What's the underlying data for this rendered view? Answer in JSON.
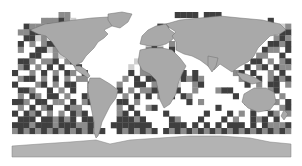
{
  "map": {
    "type": "world-grid-coverage",
    "projection": "equirectangular",
    "extent_px": {
      "x": 12,
      "y": 12,
      "width": 279,
      "height": 145
    },
    "grid": {
      "cols": 48,
      "rows": 25
    },
    "colors": {
      "background": "#ffffff",
      "land": "#a9a9a9",
      "land_border": "#6e6e6e",
      "antarctica": "#b3b3b3",
      "cell_shades": {
        "0": "#ffffff",
        "1": "#cfcfcf",
        "2": "#8c8c8c",
        "3": "#3f3f3f"
      }
    },
    "cells": [
      "000000000000000000000000000000000000000000000000",
      "000000000000000000000000000000000000000000000000",
      "000000000000000000000000000000000000000000000000",
      "000000000000000000000000000000000000000000000000",
      "000000000000000000000000000000000000000000000000",
      "000000000000000000000000000000000000000000000000",
      "000000000000000000000000000000000000000000000000",
      "000000000000000000000000000000000000000000000000",
      "000000000000000000000000000000000000000000000000",
      "000000000000000000000000000000000000000000000000",
      "000000000000000000000000000000000000000000000000",
      "000000000000000000000000000000000000000000000000",
      "000000000000000000000000000000000000000000000000",
      "000000000000000000000000000000000000000000000000",
      "000000000000000000000000000000000000000000000000",
      "000000000000000000000000000000000000000000000000",
      "000000000000000000000000000000000000000000000000",
      "000000000000000000000000000000000000000000000000",
      "000000000000000000000000000000000000000000000000",
      "000000000000000000000000000000000000000000000000",
      "000000000000000000000000000000000000000000000000",
      "000000000000000000000000000000000000000000000000",
      "000000000000000000000000000000000000000000000000",
      "000000000000000000000000000000000000000000000000",
      "000000000000000000000000000000000000000000000000"
    ],
    "ocean_pattern": [
      "000000002200000000000000000033330333000000000000",
      "000002223210000000000000000000000000000000003000",
      "003222312110000000000000032000000000000000000012",
      "022331000300000000000000330000000000000000000033",
      "003312120030000000000000122000000000000000000232",
      "030202330002000000000001310200000000000000003323",
      "020033120001000000000002320300000000000000032203",
      "000330021002000000000012102000000000000000220030",
      "033202230230000000000130000200000000000003302023",
      "023020303003000000001020030010000000000030230322",
      "300203020320300000003022300023030000002303002030",
      "023302030202200000020303302003232000000230302323",
      "300023020330032000200330232010023000000030203302",
      "033200302030032000302022330230020002330000002300",
      "020320330200320300020303020303200000003002033020",
      "332033022030230000330200000000302000000030023203",
      "020302300322003000203002300000000003000002030023",
      "303230202032303000230300003000000300030203003202",
      "033303323230330000333230000320003000302003230300",
      "333233323332233003333333000333030303033303032223",
      "232323232323232300323232303232323232323232323232",
      "000000000000000000000000000000000000000000000000",
      "000000000000000000000000000000000000000000000000",
      "000000000000000000000000000000000000000000000000",
      "000000000000000000000000000000000000000000000000"
    ]
  }
}
